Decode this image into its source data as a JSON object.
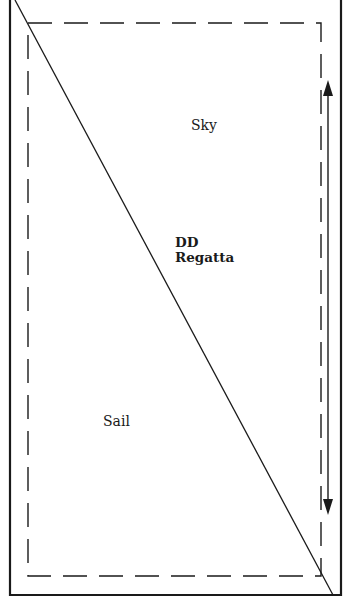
{
  "diagram": {
    "labels": {
      "sky": "Sky",
      "sail": "Sail",
      "title_line1": "DD",
      "title_line2": "Regatta"
    },
    "colors": {
      "background": "#ffffff",
      "ink": "#1a1a1a"
    },
    "elements": {
      "outer_frame": "outer-frame",
      "dashed_frame": "dashed-frame",
      "diagonal": "diagonal-line",
      "arrow": "double-headed-arrow"
    }
  }
}
